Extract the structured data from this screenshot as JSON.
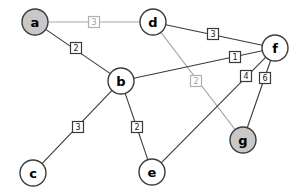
{
  "chart_data": {
    "type": "diagram",
    "title": "",
    "subtitle": "",
    "xlabel": "",
    "ylabel": "",
    "layout": {
      "width": 300,
      "height": 195,
      "background": "#ffffff",
      "grid": false,
      "legend": "none"
    },
    "style": {
      "node_radius": 13,
      "node_fill_plain": "#ffffff",
      "node_fill_highlight": "#c8c8c8",
      "node_stroke": "#3c3c3c",
      "edge_color": "#3a3a3a",
      "edge_color_dim": "#a8a8a8",
      "label_box_fill": "#ffffff",
      "label_text_color": "#1a1a1a",
      "label_text_color_dim": "#a0a0a0"
    },
    "nodes": [
      {
        "id": "a",
        "label": "a",
        "x": 35,
        "y": 22,
        "highlighted": true
      },
      {
        "id": "d",
        "label": "d",
        "x": 153,
        "y": 22,
        "highlighted": false
      },
      {
        "id": "f",
        "label": "f",
        "x": 275,
        "y": 48,
        "highlighted": false
      },
      {
        "id": "b",
        "label": "b",
        "x": 121,
        "y": 81,
        "highlighted": false
      },
      {
        "id": "g",
        "label": "g",
        "x": 243,
        "y": 140,
        "highlighted": true
      },
      {
        "id": "c",
        "label": "c",
        "x": 33,
        "y": 173,
        "highlighted": false
      },
      {
        "id": "e",
        "label": "e",
        "x": 152,
        "y": 172,
        "highlighted": false
      }
    ],
    "edges": [
      {
        "id": "a-d",
        "source": "a",
        "target": "d",
        "weight": "3",
        "label_x": 94,
        "label_y": 22,
        "dim": true
      },
      {
        "id": "a-b",
        "source": "a",
        "target": "b",
        "weight": "2",
        "label_x": 76,
        "label_y": 48,
        "dim": false
      },
      {
        "id": "d-f",
        "source": "d",
        "target": "f",
        "weight": "3",
        "label_x": 213,
        "label_y": 34,
        "dim": false
      },
      {
        "id": "d-g",
        "source": "d",
        "target": "g",
        "weight": "2",
        "label_x": 196,
        "label_y": 81,
        "dim": true
      },
      {
        "id": "b-f",
        "source": "b",
        "target": "f",
        "weight": "1",
        "label_x": 235,
        "label_y": 57,
        "dim": false
      },
      {
        "id": "b-c",
        "source": "b",
        "target": "c",
        "weight": "3",
        "label_x": 78,
        "label_y": 127,
        "dim": false
      },
      {
        "id": "b-e",
        "source": "b",
        "target": "e",
        "weight": "2",
        "label_x": 137,
        "label_y": 127,
        "dim": false
      },
      {
        "id": "e-f",
        "source": "e",
        "target": "f",
        "weight": "4",
        "label_x": 246,
        "label_y": 76,
        "dim": false
      },
      {
        "id": "f-g",
        "source": "f",
        "target": "g",
        "weight": "6",
        "label_x": 265,
        "label_y": 78,
        "dim": false
      }
    ]
  }
}
